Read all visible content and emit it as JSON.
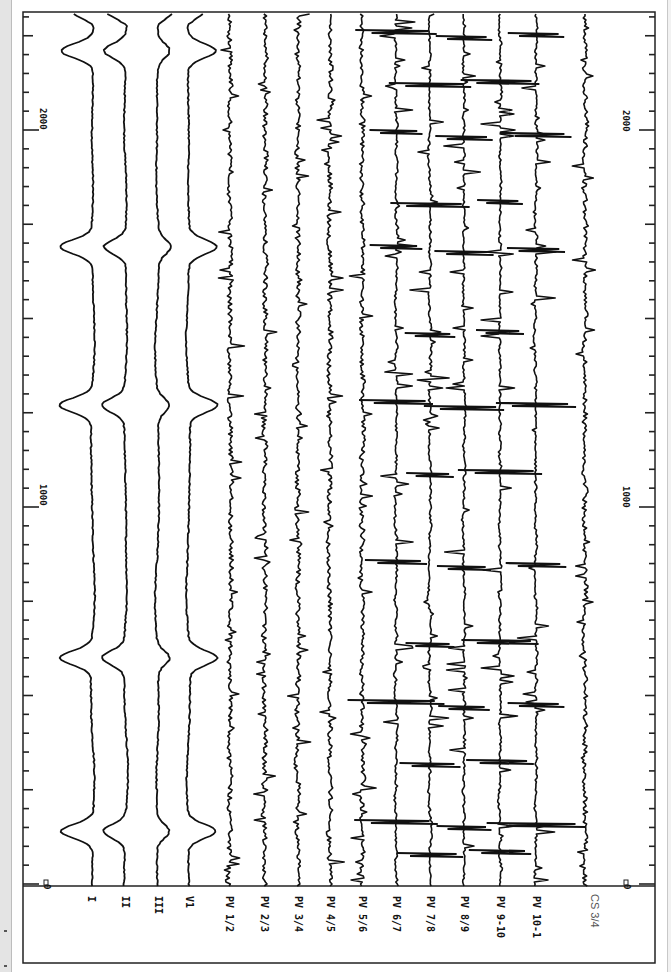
{
  "chart_data": {
    "type": "line",
    "title": "",
    "orientation": "rotated-90 (time runs bottom-to-top, channels left-to-right)",
    "xlabel": "time (ms)",
    "ylabel": "",
    "time_axis": {
      "range_ms": [
        0,
        2300
      ],
      "major_ticks": [
        0,
        1000,
        2000
      ],
      "tick_labels": [
        "0",
        "1000",
        "2000"
      ],
      "minor_tick_ms": 50,
      "medium_tick_ms": 250
    },
    "grid": false,
    "legend": "none (channel labels along bottom edge)",
    "channels": [
      {
        "name": "I",
        "type": "surface"
      },
      {
        "name": "II",
        "type": "surface"
      },
      {
        "name": "III",
        "type": "surface"
      },
      {
        "name": "V1",
        "type": "surface"
      },
      {
        "name": "PV 1/2",
        "type": "intracardiac"
      },
      {
        "name": "PV 2/3",
        "type": "intracardiac"
      },
      {
        "name": "PV 3/4",
        "type": "intracardiac"
      },
      {
        "name": "PV 4/5",
        "type": "intracardiac"
      },
      {
        "name": "PV 5/6",
        "type": "intracardiac"
      },
      {
        "name": "PV 6/7",
        "type": "intracardiac"
      },
      {
        "name": "PV 7/8",
        "type": "intracardiac"
      },
      {
        "name": "PV 8/9",
        "type": "intracardiac"
      },
      {
        "name": "PV 9-10",
        "type": "intracardiac"
      },
      {
        "name": "PV 10-1",
        "type": "intracardiac"
      },
      {
        "name": "CS 3/4",
        "type": "intracardiac"
      }
    ],
    "qrs_times_ms": [
      140,
      600,
      1270,
      1690,
      2210
    ],
    "surface_qrs_polarity": {
      "I": "negative",
      "II": "negative",
      "III": "positive",
      "V1": "positive"
    }
  },
  "labels": {
    "I": "I",
    "II": "II",
    "III": "III",
    "V1": "V1",
    "PV12": "PV 1/2",
    "PV23": "PV 2/3",
    "PV34": "PV 3/4",
    "PV45": "PV 4/5",
    "PV56": "PV 5/6",
    "PV67": "PV 6/7",
    "PV78": "PV 7/8",
    "PV89": "PV 8/9",
    "PV910": "PV 9-10",
    "PV101": "PV 10-1",
    "CS34": "CS 3/4"
  },
  "axis": {
    "left_0": "0",
    "left_1000": "1000",
    "left_2000": "2000",
    "right_0": "0",
    "right_1000": "1000",
    "right_2000": "2000"
  },
  "colors": {
    "trace": "#111111",
    "frame": "#222222",
    "background": "#ffffff",
    "cs_label": "#555555"
  }
}
